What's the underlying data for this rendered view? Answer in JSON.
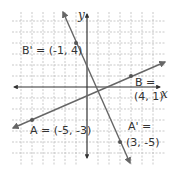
{
  "diagram": {
    "type": "coordinate-plane",
    "grid": {
      "visible": true,
      "style": "dashed",
      "color": "#bbbbbb"
    },
    "axes": {
      "x_label": "x",
      "y_label": "y",
      "color": "#333333"
    },
    "line_color": "#666666",
    "points": [
      {
        "name": "B'",
        "x": -1,
        "y": 4,
        "label": "B' = (-1, 4)"
      },
      {
        "name": "B",
        "x": 4,
        "y": 1,
        "label_line1": "B =",
        "label_line2": "(4, 1)"
      },
      {
        "name": "A",
        "x": -5,
        "y": -3,
        "label": "A = (-5, -3)"
      },
      {
        "name": "A'",
        "x": 3,
        "y": -5,
        "label_line1": "A' =",
        "label_line2": "(3, -5)"
      }
    ],
    "lines": [
      {
        "through": [
          "A",
          "B"
        ],
        "arrows": "both"
      },
      {
        "through": [
          "B'",
          "A'"
        ],
        "arrows": "both"
      }
    ]
  }
}
